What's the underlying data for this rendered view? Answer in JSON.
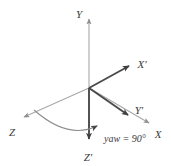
{
  "figure": {
    "type": "vector-diagram",
    "background_color": "#ffffff",
    "width": 171,
    "height": 166,
    "origin": {
      "x": 89,
      "y": 88
    },
    "colors": {
      "fixed_axis": "#a8a8a8",
      "rotated_axis": "#4a4a4a",
      "arc": "#8e8e8e",
      "label": "#3a3a3a"
    },
    "axes": [
      {
        "id": "y-axis",
        "label": "Y",
        "kind": "fixed",
        "style": "thin-light",
        "from": {
          "x": 89,
          "y": 88
        },
        "to": {
          "x": 89,
          "y": 16
        },
        "arrow": true,
        "label_pos": {
          "x": 79,
          "y": 14
        }
      },
      {
        "id": "x-axis",
        "label": "X",
        "kind": "fixed",
        "style": "thin-light",
        "from": {
          "x": 89,
          "y": 88
        },
        "to": {
          "x": 152,
          "y": 125
        },
        "arrow": true,
        "label_pos": {
          "x": 156,
          "y": 136
        }
      },
      {
        "id": "z-axis",
        "label": "Z",
        "kind": "fixed",
        "style": "thin-light",
        "from": {
          "x": 89,
          "y": 88
        },
        "to": {
          "x": 21,
          "y": 119
        },
        "arrow": true,
        "label_pos": {
          "x": 10,
          "y": 134
        }
      },
      {
        "id": "x-prime-axis",
        "label": "X'",
        "kind": "rotated",
        "style": "thick-dark",
        "from": {
          "x": 89,
          "y": 88
        },
        "to": {
          "x": 133,
          "y": 63
        },
        "arrow": true,
        "label_pos": {
          "x": 137,
          "y": 64
        }
      },
      {
        "id": "y-prime-axis",
        "label": "Y'",
        "kind": "rotated",
        "style": "thick-dark",
        "from": {
          "x": 89,
          "y": 88
        },
        "to": {
          "x": 132,
          "y": 118
        },
        "arrow": true,
        "label_pos": {
          "x": 134,
          "y": 112
        }
      },
      {
        "id": "z-prime-axis",
        "label": "Z'",
        "kind": "rotated",
        "style": "thick-dark",
        "from": {
          "x": 89,
          "y": 88
        },
        "to": {
          "x": 89,
          "y": 143
        },
        "arrow": true,
        "label_pos": {
          "x": 85,
          "y": 159
        }
      }
    ],
    "arc": {
      "id": "yaw-arc",
      "from": {
        "x": 34,
        "y": 110
      },
      "to": {
        "x": 101,
        "y": 126
      },
      "arrow": true,
      "direction": "from Z toward X",
      "sweep_label": "yaw = 90°"
    },
    "annotation": {
      "text": "yaw = 90°",
      "value": 90,
      "unit": "degrees",
      "pos": {
        "x": 103,
        "y": 139
      }
    }
  }
}
